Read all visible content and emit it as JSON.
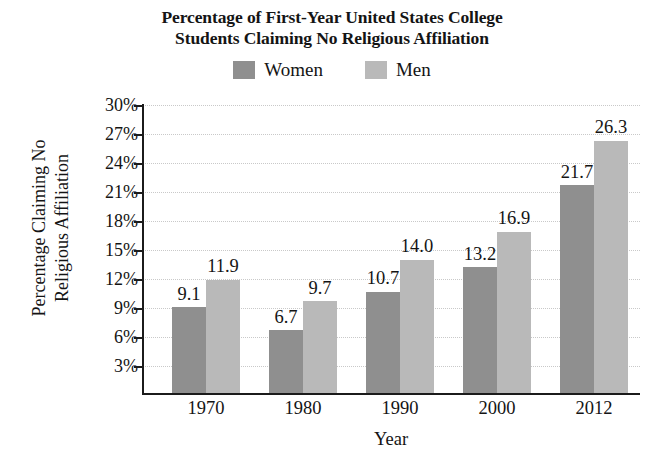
{
  "chart_data": {
    "type": "bar",
    "title": "Percentage of First-Year United States College Students Claiming No Religious Affiliation",
    "title_lines": [
      "Percentage of First-Year United States College",
      "Students Claiming No Religious Affiliation"
    ],
    "xlabel": "Year",
    "ylabel": "Percentage Claiming No Religious Affiliation",
    "ylabel_lines": [
      "Percentage Claiming No",
      "Religious Affiliation"
    ],
    "categories": [
      "1970",
      "1980",
      "1990",
      "2000",
      "2012"
    ],
    "series": [
      {
        "name": "Women",
        "color": "#8f8f8f",
        "values": [
          9.1,
          6.7,
          10.7,
          13.2,
          21.7
        ]
      },
      {
        "name": "Men",
        "color": "#b9b9b9",
        "values": [
          11.9,
          9.7,
          14.0,
          16.9,
          26.3
        ]
      }
    ],
    "value_labels": {
      "Women": [
        "9.1",
        "6.7",
        "10.7",
        "13.2",
        "21.7"
      ],
      "Men": [
        "11.9",
        "9.7",
        "14.0",
        "16.9",
        "26.3"
      ]
    },
    "ylim": [
      0,
      30
    ],
    "ytick_values": [
      3,
      6,
      9,
      12,
      15,
      18,
      21,
      24,
      27,
      30
    ],
    "ytick_labels": [
      "3%",
      "6%",
      "9%",
      "12%",
      "15%",
      "18%",
      "21%",
      "24%",
      "27%",
      "30%"
    ],
    "grid": true,
    "grid_color": "#c9c9c9",
    "legend_position": "top-center",
    "axis_color": "#1b1b1b",
    "background": "#ffffff"
  },
  "legend": {
    "items": [
      {
        "label": "Women",
        "swatch_name": "legend-swatch-women"
      },
      {
        "label": "Men",
        "swatch_name": "legend-swatch-men"
      }
    ]
  }
}
